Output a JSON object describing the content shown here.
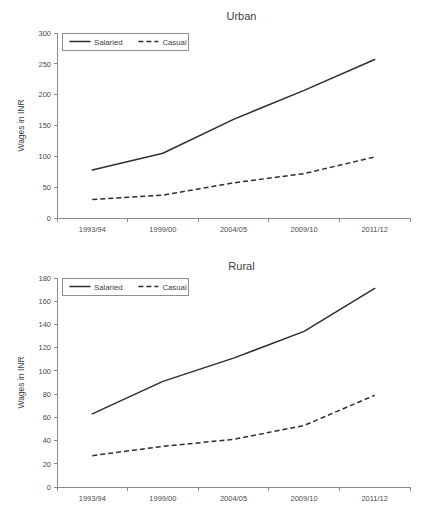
{
  "figures": [
    {
      "name": "urban",
      "title": "Urban",
      "ylabel": "Wages in INR",
      "legend": [
        "Salaried",
        "Casual"
      ]
    },
    {
      "name": "rural",
      "title": "Rural",
      "ylabel": "Wages in INR",
      "legend": [
        "Salaried",
        "Casual"
      ]
    }
  ],
  "chart_data": [
    {
      "type": "line",
      "title": "Urban",
      "xlabel": "",
      "ylabel": "Wages in INR",
      "categories": [
        "1993/94",
        "1999/00",
        "2004/05",
        "2009/10",
        "2011/12"
      ],
      "ylim": [
        0,
        300
      ],
      "yticks": [
        0,
        50,
        100,
        150,
        200,
        250,
        300
      ],
      "grid": false,
      "legend_position": "top-left",
      "series": [
        {
          "name": "Salaried",
          "style": "solid",
          "values": [
            78,
            105,
            160,
            207,
            257
          ]
        },
        {
          "name": "Casual",
          "style": "dashed",
          "values": [
            30,
            37,
            57,
            72,
            99
          ]
        }
      ]
    },
    {
      "type": "line",
      "title": "Rural",
      "xlabel": "",
      "ylabel": "Wages in INR",
      "categories": [
        "1993/94",
        "1999/00",
        "2004/05",
        "2009/10",
        "2011/12"
      ],
      "ylim": [
        0,
        180
      ],
      "yticks": [
        0,
        20,
        40,
        60,
        80,
        100,
        120,
        140,
        160,
        180
      ],
      "grid": false,
      "legend_position": "top-left",
      "series": [
        {
          "name": "Salaried",
          "style": "solid",
          "values": [
            63,
            91,
            111,
            134,
            171
          ]
        },
        {
          "name": "Casual",
          "style": "dashed",
          "values": [
            27,
            35,
            41,
            53,
            79
          ]
        }
      ]
    }
  ]
}
